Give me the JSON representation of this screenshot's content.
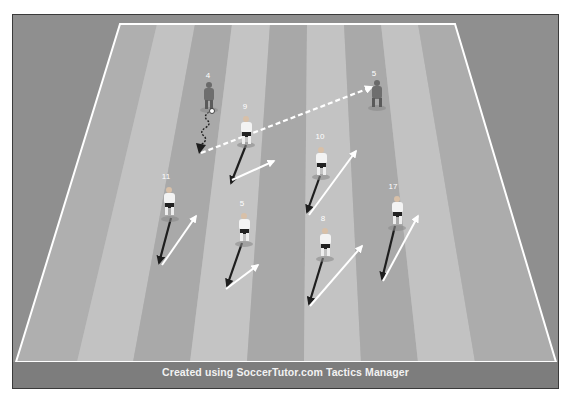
{
  "diagram": {
    "type": "soccer-tactics-drill",
    "footer": "Created using SoccerTutor.com Tactics Manager",
    "colors": {
      "outer_background": "#8c8c8c",
      "stripe_light": "#bdbdbd",
      "stripe_dark": "#a9a9a9",
      "field_lines": "#ffffff",
      "team_attack": "#f0f0f0",
      "team_defend": "#6e6e6e",
      "run_arrow": "#ffffff",
      "movement_arrow": "#222222"
    },
    "players": [
      {
        "number": "4",
        "team": "dark",
        "x": 209,
        "y": 95,
        "has_ball": true
      },
      {
        "number": "5",
        "team": "dark",
        "x": 377,
        "y": 93,
        "has_ball": false
      },
      {
        "number": "9",
        "team": "white",
        "x": 248,
        "y": 128
      },
      {
        "number": "10",
        "team": "white",
        "x": 321,
        "y": 157
      },
      {
        "number": "11",
        "team": "white",
        "x": 169,
        "y": 200
      },
      {
        "number": "5",
        "team": "white",
        "x": 244,
        "y": 225
      },
      {
        "number": "8",
        "team": "white",
        "x": 325,
        "y": 240
      },
      {
        "number": "17",
        "team": "white",
        "x": 396,
        "y": 207
      }
    ],
    "labels": {
      "p4": "4",
      "p5_dark": "5",
      "p9": "9",
      "p10": "10",
      "p11": "11",
      "p5_white": "5",
      "p8": "8",
      "p17": "17"
    }
  }
}
